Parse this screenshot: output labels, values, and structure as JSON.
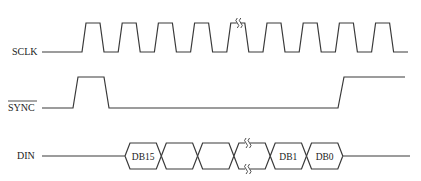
{
  "diagram": {
    "type": "timing-diagram",
    "signals": [
      {
        "name": "SCLK",
        "overline": false,
        "kind": "clock",
        "pulses_before_break": 4,
        "pulses_after_break": 5,
        "has_break_mark": true
      },
      {
        "name": "SYNC",
        "overline": true,
        "kind": "level",
        "sequence": [
          "low",
          "high",
          "low",
          "high"
        ]
      },
      {
        "name": "DIN",
        "overline": false,
        "kind": "bus",
        "cells": [
          "DB15",
          "",
          "",
          "",
          "DB1",
          "DB0"
        ],
        "break_after_cell": 3
      }
    ],
    "colors": {
      "line": "#3a3a3a",
      "text": "#222222",
      "background": "#ffffff"
    }
  }
}
